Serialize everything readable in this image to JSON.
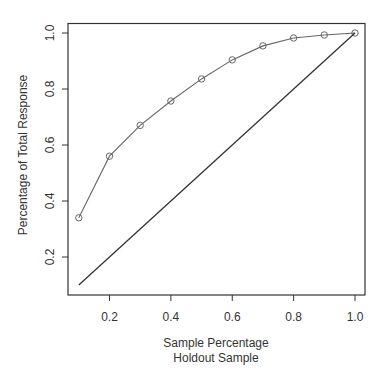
{
  "chart_data": {
    "type": "line",
    "title": "",
    "xlabel": "Sample Percentage",
    "xlabel_sub": "Holdout Sample",
    "ylabel": "Percentage of Total Response",
    "x_ticks": [
      "0.2",
      "0.4",
      "0.6",
      "0.8",
      "1.0"
    ],
    "y_ticks": [
      "0.2",
      "0.4",
      "0.6",
      "0.8",
      "1.0"
    ],
    "xlim": [
      0.07,
      1.03
    ],
    "ylim": [
      0.07,
      1.03
    ],
    "grid": false,
    "legend": null,
    "series": [
      {
        "name": "Cumulative response (gains)",
        "marker": "circle",
        "x": [
          0.1,
          0.2,
          0.3,
          0.4,
          0.5,
          0.6,
          0.7,
          0.8,
          0.9,
          1.0
        ],
        "y": [
          0.34,
          0.56,
          0.67,
          0.757,
          0.836,
          0.904,
          0.954,
          0.982,
          0.993,
          1.0
        ]
      },
      {
        "name": "Baseline (random)",
        "marker": "none",
        "x": [
          0.1,
          1.0
        ],
        "y": [
          0.1,
          1.0
        ]
      }
    ]
  },
  "colors": {
    "axis": "#333333",
    "gains_line": "#666666",
    "baseline": "#333333"
  }
}
